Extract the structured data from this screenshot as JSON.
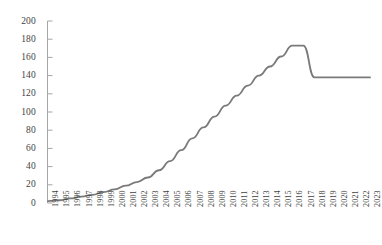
{
  "chart_data": {
    "type": "line",
    "title": "",
    "subtitle": "",
    "xlabel": "",
    "ylabel": "",
    "grid": false,
    "legend": null,
    "legend_position": "none",
    "line_color": "#7a7a7a",
    "axis_color": "#a6a6a6",
    "tick_label_color": "#3f3f3f",
    "ylim": [
      0,
      200
    ],
    "ytick_step": 20,
    "ytick_labels": [
      "0",
      "20",
      "40",
      "60",
      "80",
      "100",
      "120",
      "140",
      "160",
      "180",
      "200"
    ],
    "ytick_values": [
      0,
      20,
      40,
      60,
      80,
      100,
      120,
      140,
      160,
      180,
      200
    ],
    "categories": [
      "1994",
      "1995",
      "1996",
      "1997",
      "1998",
      "1999",
      "2000",
      "2001",
      "2002",
      "2003",
      "2004",
      "2005",
      "2006",
      "2007",
      "2008",
      "2009",
      "2010",
      "2011",
      "2012",
      "2013",
      "2014",
      "2015",
      "2016",
      "2017",
      "2018",
      "2019",
      "2020",
      "2021",
      "2022",
      "2023"
    ],
    "values": [
      2,
      3,
      5,
      7,
      9,
      12,
      15,
      19,
      23,
      28,
      36,
      46,
      58,
      71,
      83,
      95,
      107,
      118,
      129,
      140,
      150,
      161,
      173,
      173,
      138,
      138,
      138,
      138,
      138,
      138
    ]
  }
}
